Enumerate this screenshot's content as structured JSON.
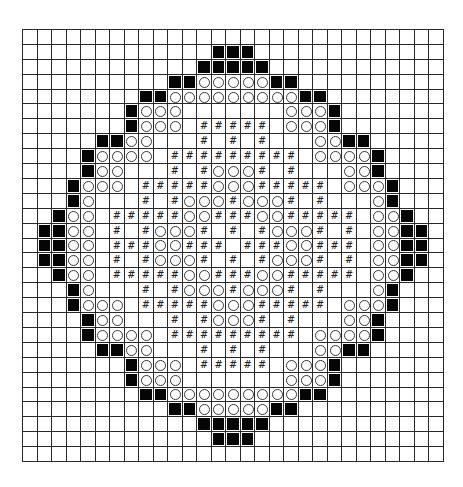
{
  "chart_data": {
    "type": "grid-pattern",
    "title": "",
    "columns": 29,
    "rows": 29,
    "legend": {
      ".": "empty",
      "B": "filled-black-square",
      "O": "open-circle",
      "#": "hash-symbol"
    },
    "colors": {
      "grid_line": "#2a2a2a",
      "filled": "#050505",
      "background": "#ffffff"
    },
    "grid": [
      ".............................",
      ".............BBB.............",
      "............BBBBB............",
      "..........BBOOOOOBB..........",
      "........BBOOOOOOOOOBB........",
      ".......BOOO.......OOOB.......",
      ".......BOOO.#####.OOOB.......",
      ".....BBOO...#.#.#...OOBB.....",
      "....BOOOO.#########.OOOOB....",
      "....BOO...#.#OOO#.#...OOB....",
      "...BOOO.#####OOO#####.OOOB...",
      "...BO...#.#OOO#OOO#.#...OB...",
      "..BOO.#####OO###OO#####.OOB..",
      ".BBOO.#.#OOO#.#.#OOO#.#.OOBB.",
      ".BBOO.###OO###.###OO###.OOBB.",
      ".BBOO.#.#OOO#.#.#OOO#.#.OOBB.",
      "..BOO.#####OO###OO#####.OOB..",
      "...BO...#.#OOO#OOO#.#...OB...",
      "...BOOO.#####OOO#####.OOOB...",
      "....BOO...#.#OOO#.#...OOB....",
      "....BOOOO.#########.OOOOB....",
      ".....BBOO...#.#.#...OOBB.....",
      ".......BOOO.#####.OOOB.......",
      ".......BOOO.......OOOB.......",
      "........BBOOOOOOOOOBB........",
      "..........BBOOOOOBB..........",
      "............BBBBB............",
      ".............BBB.............",
      "............................."
    ]
  }
}
